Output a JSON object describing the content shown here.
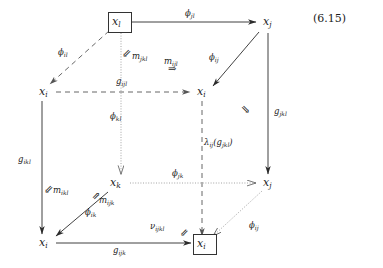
{
  "figure": {
    "equation_number": "(6.15)",
    "type": "commutative-cube-diagram",
    "stroke_color": "#2b2b2b",
    "text_color": "#1c1c1c",
    "background": "#ffffff"
  },
  "nodes": [
    {
      "id": "x_l_back_top_left",
      "base": "x",
      "sub": "l",
      "boxed": true,
      "x": 112,
      "y": 22
    },
    {
      "id": "x_j_back_top_right",
      "base": "x",
      "sub": "j",
      "boxed": false,
      "x": 266,
      "y": 22
    },
    {
      "id": "x_i_front_top_left",
      "base": "x",
      "sub": "i",
      "boxed": false,
      "x": 42,
      "y": 92
    },
    {
      "id": "x_i_front_top_right",
      "base": "x",
      "sub": "i",
      "boxed": false,
      "x": 200,
      "y": 92
    },
    {
      "id": "x_k_back_bot_left",
      "base": "x",
      "sub": "k",
      "boxed": false,
      "x": 112,
      "y": 183
    },
    {
      "id": "x_j_back_bot_right",
      "base": "x",
      "sub": "j",
      "boxed": false,
      "x": 266,
      "y": 183
    },
    {
      "id": "x_i_front_bot_left",
      "base": "x",
      "sub": "i",
      "boxed": false,
      "x": 42,
      "y": 243
    },
    {
      "id": "x_i_front_bot_right",
      "base": "x",
      "sub": "i",
      "boxed": true,
      "x": 200,
      "y": 243
    }
  ],
  "edge_labels": [
    {
      "id": "phi_jl",
      "base": "ϕ",
      "sub": "jl",
      "x": 185,
      "y": 14,
      "style": "solid"
    },
    {
      "id": "phi_il",
      "base": "ϕ",
      "sub": "il",
      "x": 58,
      "y": 53,
      "style": "dashed"
    },
    {
      "id": "phi_ij_up",
      "base": "ϕ",
      "sub": "ij",
      "x": 209,
      "y": 58,
      "style": "solid"
    },
    {
      "id": "g_ijl",
      "base": "g",
      "sub": "ijl",
      "x": 135,
      "y": 83,
      "style": "dashed"
    },
    {
      "id": "g_jkl",
      "base": "g",
      "sub": "jkl",
      "x": 274,
      "y": 112,
      "style": "solid"
    },
    {
      "id": "phi_kl",
      "base": "ϕ",
      "sub": "kl",
      "x": 110,
      "y": 117,
      "style": "dotted"
    },
    {
      "id": "g_ikl",
      "base": "g",
      "sub": "ikl",
      "x": 18,
      "y": 160,
      "style": "solid"
    },
    {
      "id": "phi_jk",
      "base": "ϕ",
      "sub": "jk",
      "x": 175,
      "y": 174,
      "style": "dotted"
    },
    {
      "id": "phi_ik",
      "base": "ϕ",
      "sub": "ik",
      "x": 85,
      "y": 213,
      "style": "solid"
    },
    {
      "id": "phi_ij_lo",
      "base": "ϕ",
      "sub": "ij",
      "x": 249,
      "y": 226,
      "style": "dotted"
    },
    {
      "id": "g_ijk",
      "base": "g",
      "sub": "ijk",
      "x": 115,
      "y": 251,
      "style": "solid"
    }
  ],
  "lambda_label": {
    "id": "lambda_ij_g_jkl",
    "text_prefix": "λ",
    "sub1": "ij",
    "text_mid": "(g",
    "sub2": "jkl",
    "text_suffix": ")",
    "x": 204,
    "y": 143
  },
  "two_cells": [
    {
      "id": "m_jkl",
      "base": "m",
      "sub": "jkl",
      "x": 132,
      "y": 53,
      "arrow": "⇙"
    },
    {
      "id": "m_ijl",
      "base": "m",
      "sub": "ijl",
      "x": 164,
      "y": 62,
      "arrow": "⇒"
    },
    {
      "id": "m_ikl",
      "base": "m",
      "sub": "ikl",
      "x": 53,
      "y": 188,
      "arrow": "⇙"
    },
    {
      "id": "m_ijk",
      "base": "m",
      "sub": "ijk",
      "x": 97,
      "y": 196,
      "arrow": "⇗"
    },
    {
      "id": "nu_ijkl",
      "base": "ν",
      "sub": "ijkl",
      "x": 150,
      "y": 223,
      "arrow": "⇙"
    },
    {
      "id": "unlabeled_right",
      "base": "",
      "sub": "",
      "x": 244,
      "y": 108,
      "arrow": "⇘"
    }
  ]
}
